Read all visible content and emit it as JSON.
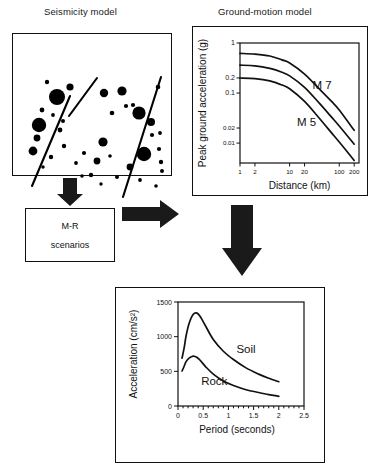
{
  "figure": {
    "kind": "seismic-hazard-flowchart",
    "panels": {
      "seismicity": {
        "title": "Seismicity model"
      },
      "ground_motion": {
        "title": "Ground-motion model"
      },
      "scenarios": {
        "line1": "M-R",
        "line2": "scenarios"
      },
      "spectrum": {
        "title": ""
      }
    },
    "arrows": [
      {
        "name": "seismicity-to-scenarios",
        "direction": "down"
      },
      {
        "name": "scenarios-to-groundmotion",
        "direction": "right"
      },
      {
        "name": "groundmotion-to-spectrum",
        "direction": "down"
      }
    ]
  },
  "seismicity_map": {
    "faults": [
      {
        "name": "fault-left-lower",
        "x1": 19,
        "y1": 152,
        "x2": 57,
        "y2": 62
      },
      {
        "name": "fault-left-upper",
        "x1": 56,
        "y1": 82,
        "x2": 84,
        "y2": 44
      },
      {
        "name": "fault-right",
        "x1": 110,
        "y1": 163,
        "x2": 148,
        "y2": 43
      }
    ],
    "epicenters": [
      {
        "cx": 44,
        "cy": 63,
        "r": 8.0
      },
      {
        "cx": 57,
        "cy": 53,
        "r": 3.6
      },
      {
        "cx": 34,
        "cy": 48,
        "r": 2.2
      },
      {
        "cx": 26,
        "cy": 91,
        "r": 7.2
      },
      {
        "cx": 24,
        "cy": 104,
        "r": 3.4
      },
      {
        "cx": 20,
        "cy": 117,
        "r": 4.4
      },
      {
        "cx": 29,
        "cy": 76,
        "r": 2.4
      },
      {
        "cx": 40,
        "cy": 81,
        "r": 1.9
      },
      {
        "cx": 47,
        "cy": 96,
        "r": 2.4
      },
      {
        "cx": 50,
        "cy": 87,
        "r": 2.0
      },
      {
        "cx": 38,
        "cy": 123,
        "r": 2.2
      },
      {
        "cx": 51,
        "cy": 112,
        "r": 2.2
      },
      {
        "cx": 30,
        "cy": 133,
        "r": 1.7
      },
      {
        "cx": 63,
        "cy": 129,
        "r": 1.9
      },
      {
        "cx": 71,
        "cy": 119,
        "r": 2.1
      },
      {
        "cx": 78,
        "cy": 141,
        "r": 2.2
      },
      {
        "cx": 90,
        "cy": 108,
        "r": 4.6
      },
      {
        "cx": 84,
        "cy": 127,
        "r": 3.4
      },
      {
        "cx": 91,
        "cy": 59,
        "r": 4.2
      },
      {
        "cx": 99,
        "cy": 79,
        "r": 2.3
      },
      {
        "cx": 109,
        "cy": 57,
        "r": 4.6
      },
      {
        "cx": 113,
        "cy": 72,
        "r": 2.1
      },
      {
        "cx": 120,
        "cy": 71,
        "r": 2.1
      },
      {
        "cx": 126,
        "cy": 79,
        "r": 6.6
      },
      {
        "cx": 138,
        "cy": 88,
        "r": 4.0
      },
      {
        "cx": 145,
        "cy": 53,
        "r": 2.3
      },
      {
        "cx": 139,
        "cy": 101,
        "r": 2.1
      },
      {
        "cx": 147,
        "cy": 99,
        "r": 1.9
      },
      {
        "cx": 131,
        "cy": 120,
        "r": 7.2
      },
      {
        "cx": 146,
        "cy": 115,
        "r": 2.1
      },
      {
        "cx": 148,
        "cy": 128,
        "r": 2.2
      },
      {
        "cx": 149,
        "cy": 137,
        "r": 2.0
      },
      {
        "cx": 117,
        "cy": 133,
        "r": 3.4
      },
      {
        "cx": 104,
        "cy": 143,
        "r": 2.0
      },
      {
        "cx": 127,
        "cy": 146,
        "r": 1.9
      },
      {
        "cx": 143,
        "cy": 152,
        "r": 1.8
      },
      {
        "cx": 97,
        "cy": 122,
        "r": 1.8
      },
      {
        "cx": 69,
        "cy": 142,
        "r": 1.8
      },
      {
        "cx": 88,
        "cy": 150,
        "r": 1.7
      }
    ]
  },
  "chart_data": [
    {
      "name": "ground-motion-attenuation",
      "type": "line",
      "title": "Ground-motion model",
      "xlabel": "Distance (km)",
      "ylabel": "Peak ground acceleration (g)",
      "xscale": "log",
      "yscale": "log",
      "xlim": [
        1,
        250
      ],
      "ylim": [
        0.004,
        1.0
      ],
      "xticks": [
        1,
        2,
        10,
        20,
        100,
        200
      ],
      "xticklabels": [
        "1",
        "2",
        "10",
        "20",
        "100",
        "200"
      ],
      "yticks": [
        1,
        0.2,
        0.1,
        0.02,
        0.01
      ],
      "yticklabels": [
        "1",
        "0.2",
        "0.1",
        "0.02",
        "0.01"
      ],
      "grid": false,
      "annotations": [
        {
          "text": "M 7",
          "x": 45,
          "y": 0.12
        },
        {
          "text": "M 5",
          "x": 22,
          "y": 0.022
        }
      ],
      "series": [
        {
          "name": "M 7",
          "x": [
            1,
            2,
            4,
            7,
            10,
            20,
            40,
            70,
            100,
            200
          ],
          "y": [
            0.62,
            0.6,
            0.55,
            0.46,
            0.4,
            0.24,
            0.12,
            0.068,
            0.046,
            0.018
          ]
        },
        {
          "name": "M 6",
          "x": [
            1,
            2,
            4,
            7,
            10,
            20,
            40,
            70,
            100,
            200
          ],
          "y": [
            0.36,
            0.35,
            0.31,
            0.26,
            0.22,
            0.13,
            0.062,
            0.033,
            0.022,
            0.0095
          ]
        },
        {
          "name": "M 5",
          "x": [
            1,
            2,
            4,
            7,
            10,
            20,
            40,
            70,
            100,
            200
          ],
          "y": [
            0.2,
            0.195,
            0.175,
            0.145,
            0.122,
            0.068,
            0.031,
            0.016,
            0.0105,
            0.0045
          ]
        }
      ]
    },
    {
      "name": "response-spectrum",
      "type": "line",
      "title": "",
      "xlabel": "Period (seconds)",
      "ylabel": "Acceleration (cm/s²)",
      "xscale": "linear",
      "yscale": "linear",
      "xlim": [
        0,
        2.5
      ],
      "ylim": [
        0,
        1500
      ],
      "xticks": [
        0,
        0.5,
        1,
        1.5,
        2,
        2.5
      ],
      "xticklabels": [
        "0",
        "0.5",
        "1",
        "1.5",
        "2",
        "2.5"
      ],
      "yticks": [
        0,
        500,
        1000,
        1500
      ],
      "yticklabels": [
        "0",
        "500",
        "1000",
        "1500"
      ],
      "grid": false,
      "annotations": [
        {
          "text": "Soil",
          "x": 1.35,
          "y": 760
        },
        {
          "text": "Rock",
          "x": 0.72,
          "y": 300
        }
      ],
      "series": [
        {
          "name": "Soil",
          "x": [
            0.08,
            0.12,
            0.16,
            0.22,
            0.3,
            0.38,
            0.45,
            0.55,
            0.7,
            0.9,
            1.1,
            1.35,
            1.6,
            1.8,
            2.0
          ],
          "y": [
            690,
            830,
            1010,
            1190,
            1320,
            1340,
            1280,
            1150,
            960,
            790,
            670,
            550,
            460,
            400,
            350
          ]
        },
        {
          "name": "Rock",
          "x": [
            0.08,
            0.12,
            0.16,
            0.22,
            0.3,
            0.38,
            0.45,
            0.55,
            0.7,
            0.9,
            1.1,
            1.35,
            1.6,
            1.8,
            2.0
          ],
          "y": [
            505,
            570,
            640,
            690,
            720,
            700,
            650,
            565,
            460,
            360,
            295,
            235,
            195,
            165,
            140
          ]
        }
      ]
    }
  ]
}
